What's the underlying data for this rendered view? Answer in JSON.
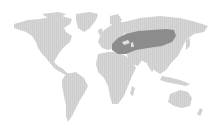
{
  "map": {
    "type": "world-range-map",
    "projection": "equirectangular-like",
    "background_color": "#ffffff",
    "land_color": "#d3d3d3",
    "range_color": "#8c8c8c",
    "range_region": "Southeastern Europe to Central Asia (Balkans, Anatolia, Caucasus, Kazakh steppe to Mongolia)",
    "continents": [
      "North America",
      "Greenland",
      "South America",
      "Europe",
      "Africa",
      "Asia",
      "Australia",
      "New Zealand"
    ]
  }
}
